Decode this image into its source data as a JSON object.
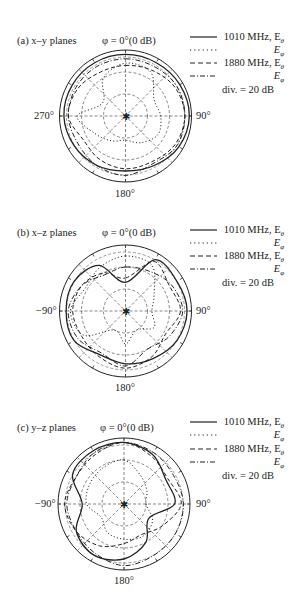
{
  "chart_data": [
    {
      "type": "polar",
      "panel_label": "(a) x–y planes",
      "title": "φ = 0°(0 dB)",
      "angle_labels": {
        "top": "φ = 0°(0 dB)",
        "right": "90°",
        "bottom": "180°",
        "left": "270°"
      },
      "radial_division_db": 20,
      "radial_range_db": [
        -60,
        0
      ],
      "grid": true,
      "legend": [
        "1010 MHz, Eθ",
        "Eφ",
        "1880 MHz, Eθ",
        "Eφ",
        "div. = 20 dB"
      ],
      "angles_deg": [
        0,
        30,
        60,
        90,
        120,
        150,
        180,
        210,
        240,
        270,
        300,
        330
      ],
      "series": [
        {
          "name": "1010 MHz, Eθ",
          "style": "solid",
          "values_db": [
            -4,
            -4,
            -3,
            -2,
            -4,
            -8,
            -10,
            -8,
            -6,
            -4,
            -4,
            -4
          ]
        },
        {
          "name": "1010 MHz, Eφ",
          "style": "dotted",
          "values_db": [
            -12,
            -14,
            -30,
            -28,
            -26,
            -32,
            -38,
            -34,
            -28,
            -16,
            -36,
            -20
          ]
        },
        {
          "name": "1880 MHz, Eθ",
          "style": "dashed",
          "values_db": [
            -14,
            -12,
            -8,
            -6,
            -8,
            -12,
            -12,
            -14,
            -16,
            -8,
            -10,
            -14
          ]
        },
        {
          "name": "1880 MHz, Eφ",
          "style": "dashdot",
          "values_db": [
            -8,
            -8,
            -6,
            -6,
            -6,
            -10,
            -6,
            -8,
            -10,
            -8,
            -8,
            -8
          ]
        }
      ]
    },
    {
      "type": "polar",
      "panel_label": "(b) x–z planes",
      "title": "φ = 0°(0 dB)",
      "angle_labels": {
        "top": "φ = 0°(0 dB)",
        "right": "90°",
        "bottom": "180°",
        "left": "−90°"
      },
      "radial_division_db": 20,
      "radial_range_db": [
        -60,
        0
      ],
      "grid": true,
      "legend": [
        "1010 MHz, Eθ",
        "Eφ",
        "1880 MHz, Eθ",
        "Eφ",
        "div. = 20 dB"
      ],
      "angles_deg": [
        0,
        30,
        60,
        90,
        120,
        150,
        180,
        210,
        240,
        270,
        300,
        330
      ],
      "series": [
        {
          "name": "1010 MHz, Eθ",
          "style": "solid",
          "values_db": [
            -34,
            -6,
            -6,
            -4,
            -6,
            -10,
            -12,
            -14,
            -6,
            -6,
            -6,
            -12
          ]
        },
        {
          "name": "1010 MHz, Eφ",
          "style": "dotted",
          "values_db": [
            -10,
            -12,
            -30,
            -36,
            -30,
            -40,
            -30,
            -40,
            -16,
            -10,
            -18,
            -14
          ]
        },
        {
          "name": "1880 MHz, Eθ",
          "style": "dashed",
          "values_db": [
            -30,
            -8,
            -14,
            -10,
            -18,
            -12,
            -8,
            -12,
            -14,
            -12,
            -14,
            -20
          ]
        },
        {
          "name": "1880 MHz, Eφ",
          "style": "dashdot",
          "values_db": [
            -20,
            -18,
            -12,
            -8,
            -14,
            -20,
            -10,
            -16,
            -10,
            -8,
            -14,
            -22
          ]
        }
      ]
    },
    {
      "type": "polar",
      "panel_label": "(c) y–z planes",
      "title": "φ = 0°(0 dB)",
      "angle_labels": {
        "top": "φ = 0°(0 dB)",
        "right": "90°",
        "bottom": "180°",
        "left": "−90°"
      },
      "radial_division_db": 20,
      "radial_range_db": [
        -60,
        0
      ],
      "grid": true,
      "legend": [
        "1010 MHz, Eθ",
        "Eφ",
        "1880 MHz, Eθ",
        "Eφ",
        "div. = 20 dB"
      ],
      "angles_deg": [
        0,
        30,
        60,
        90,
        120,
        150,
        180,
        210,
        240,
        270,
        300,
        330
      ],
      "series": [
        {
          "name": "1010 MHz, Eθ",
          "style": "solid",
          "values_db": [
            -4,
            -8,
            -16,
            -14,
            -34,
            -20,
            -10,
            -6,
            -10,
            -22,
            -6,
            -4
          ]
        },
        {
          "name": "1010 MHz, Eφ",
          "style": "dotted",
          "values_db": [
            -20,
            -30,
            -36,
            -40,
            -30,
            -26,
            -28,
            -30,
            -36,
            -26,
            -24,
            -22
          ]
        },
        {
          "name": "1880 MHz, Eθ",
          "style": "dashed",
          "values_db": [
            -4,
            -10,
            -14,
            -8,
            -20,
            -28,
            -24,
            -16,
            -10,
            -6,
            -10,
            -8
          ]
        },
        {
          "name": "1880 MHz, Eφ",
          "style": "dashdot",
          "values_db": [
            -4,
            -6,
            -8,
            -6,
            -6,
            -6,
            -4,
            -8,
            -10,
            -8,
            -10,
            -6
          ]
        }
      ]
    }
  ],
  "panels": [
    {
      "label": "(a) x–y planes",
      "top_label": "φ = 0°(0 dB)",
      "right_label": "90°",
      "bottom_label": "180°",
      "left_label": "270°",
      "legend": {
        "r1": "1010 MHz, E",
        "r1sub": "θ",
        "r2sub": "φ",
        "r3": "1880 MHz, E",
        "r3sub": "θ",
        "r4sub": "φ",
        "div": "div. = 20 dB",
        "e": "E"
      }
    },
    {
      "label": "(b) x–z planes",
      "top_label": "φ = 0°(0 dB)",
      "right_label": "90°",
      "bottom_label": "180°",
      "left_label": "−90°",
      "legend": {
        "r1": "1010 MHz, E",
        "r1sub": "θ",
        "r2sub": "φ",
        "r3": "1880 MHz, E",
        "r3sub": "θ",
        "r4sub": "φ",
        "div": "div. = 20 dB",
        "e": "E"
      }
    },
    {
      "label": "(c) y–z planes",
      "top_label": "φ = 0°(0 dB)",
      "right_label": "90°",
      "bottom_label": "180°",
      "left_label": "−90°",
      "legend": {
        "r1": "1010 MHz, E",
        "r1sub": "θ",
        "r2sub": "φ",
        "r3": "1880 MHz, E",
        "r3sub": "θ",
        "r4sub": "φ",
        "div": "div. = 20 dB",
        "e": "E"
      }
    }
  ],
  "colors": {
    "ink": "#222222",
    "grid": "#555555",
    "background": "#ffffff"
  }
}
